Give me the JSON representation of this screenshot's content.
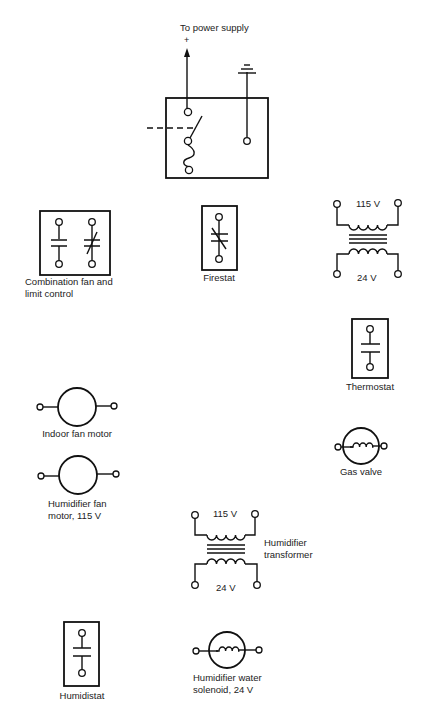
{
  "figure": {
    "power_supply": {
      "label": "To power supply",
      "positive_sign": "+"
    },
    "components": [
      {
        "id": "combination-fan-limit",
        "label_line1": "Combination fan and",
        "label_line2": "limit control"
      },
      {
        "id": "firestat",
        "label": "Firestat"
      },
      {
        "id": "main-transformer",
        "primary": "115 V",
        "secondary": "24 V"
      },
      {
        "id": "thermostat",
        "label": "Thermostat"
      },
      {
        "id": "indoor-fan-motor",
        "label": "Indoor fan motor"
      },
      {
        "id": "gas-valve",
        "label": "Gas valve"
      },
      {
        "id": "humidifier-fan-motor",
        "label_line1": "Humidifier fan",
        "label_line2": "motor, 115 V"
      },
      {
        "id": "humidifier-transformer",
        "primary": "115 V",
        "secondary": "24 V",
        "label_line1": "Humidifier",
        "label_line2": "transformer"
      },
      {
        "id": "humidistat",
        "label": "Humidistat"
      },
      {
        "id": "humidifier-water-solenoid",
        "label_line1": "Humidifier water",
        "label_line2": "solenoid, 24 V"
      }
    ]
  }
}
